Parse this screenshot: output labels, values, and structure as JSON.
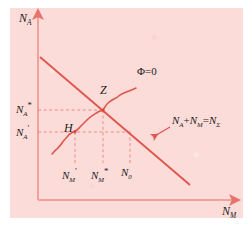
{
  "figure": {
    "background_color": "#fbdcd8",
    "axis_color": "#f4aaa4",
    "line_color": "#e0564f",
    "dash_color": "#e87f79",
    "text_color": "#1b1b1b"
  },
  "axes": {
    "y_axis_label": "N",
    "y_axis_sub": "A",
    "x_axis_label": "N",
    "x_axis_sub": "M"
  },
  "y_ticks": [
    {
      "base": "N",
      "sub": "A",
      "mark": "*",
      "value_y": 110
    },
    {
      "base": "N",
      "sub": "A",
      "mark": "′",
      "value_y": 132
    }
  ],
  "x_ticks": [
    {
      "base": "N",
      "sub": "M",
      "mark": "′",
      "value_x": 75
    },
    {
      "base": "N",
      "sub": "M",
      "mark": "*",
      "value_x": 103
    },
    {
      "base": "N",
      "sub": "0",
      "mark": "",
      "value_x": 130
    }
  ],
  "points": [
    {
      "name": "Z",
      "label": "Z",
      "x": 103,
      "y": 110
    },
    {
      "name": "H",
      "label": "H",
      "x": 75,
      "y": 132
    }
  ],
  "curves": [
    {
      "name": "phi-zero-curve",
      "label": "Φ=0",
      "kind": "wavy-sigmoid",
      "points": [
        [
          55,
          151
        ],
        [
          61,
          146
        ],
        [
          66,
          140
        ],
        [
          71,
          135
        ],
        [
          75,
          132
        ],
        [
          80,
          128
        ],
        [
          85,
          124
        ],
        [
          90,
          119
        ],
        [
          95,
          115
        ],
        [
          99,
          112
        ],
        [
          103,
          110
        ],
        [
          107,
          105
        ],
        [
          112,
          101
        ],
        [
          116,
          99
        ],
        [
          120,
          95
        ],
        [
          125,
          93
        ],
        [
          130,
          90
        ],
        [
          135,
          88
        ]
      ]
    },
    {
      "name": "conservation-line",
      "label": "N",
      "label_parts": {
        "a_base": "N",
        "a_sub": "A",
        "plus": "+",
        "m_base": "N",
        "m_sub": "M",
        "eq": "=",
        "t_base": "N",
        "t_sub": "Σ"
      },
      "kind": "straight",
      "from": [
        40,
        57
      ],
      "to": [
        190,
        185
      ]
    }
  ],
  "dashed_lines": [
    {
      "name": "h-dash-na-star",
      "orientation": "horizontal",
      "from": [
        38,
        110
      ],
      "to": [
        103,
        110
      ]
    },
    {
      "name": "h-dash-na-prime",
      "orientation": "horizontal",
      "from": [
        38,
        132
      ],
      "to": [
        75,
        132
      ]
    },
    {
      "name": "v-dash-nm-prime",
      "orientation": "vertical",
      "from": [
        75,
        132
      ],
      "to": [
        75,
        163
      ]
    },
    {
      "name": "v-dash-nm-star",
      "orientation": "vertical",
      "from": [
        103,
        110
      ],
      "to": [
        103,
        163
      ]
    },
    {
      "name": "v-dash-n0",
      "orientation": "vertical",
      "from": [
        130,
        132
      ],
      "to": [
        130,
        163
      ]
    },
    {
      "name": "h-dash-n0-level",
      "orientation": "horizontal",
      "from": [
        75,
        132
      ],
      "to": [
        130,
        132
      ]
    }
  ],
  "annotations": [
    {
      "name": "sum-arrow",
      "from": [
        170,
        128
      ],
      "to": [
        154,
        136
      ]
    }
  ]
}
